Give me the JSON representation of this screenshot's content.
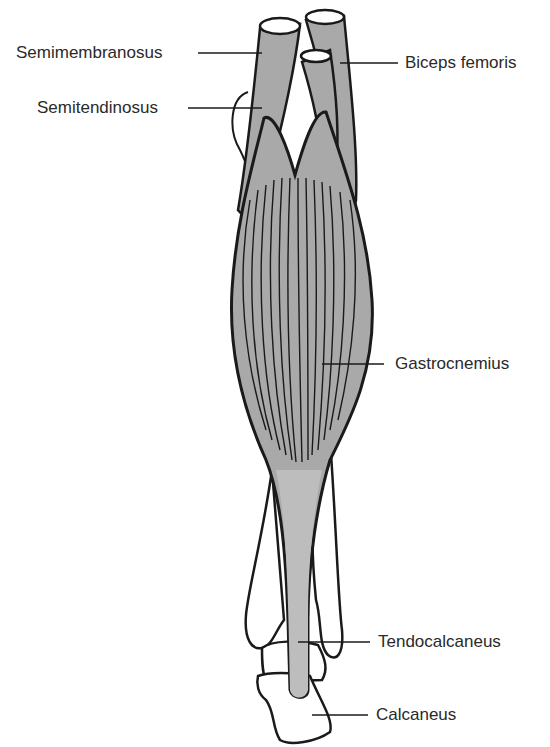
{
  "diagram": {
    "colors": {
      "muscle_fill": "#a9a9a9",
      "tendon_fill": "#b8b8b8",
      "bone_fill": "#ffffff",
      "outline": "#1a1a1a",
      "label_text": "#2a2a2a",
      "background": "#ffffff"
    },
    "labels": [
      {
        "id": "semimembranosus",
        "text": "Semimembranosus",
        "side": "left"
      },
      {
        "id": "semitendinosus",
        "text": "Semitendinosus",
        "side": "left"
      },
      {
        "id": "biceps-femoris",
        "text": "Biceps femoris",
        "side": "right"
      },
      {
        "id": "gastrocnemius",
        "text": "Gastrocnemius",
        "side": "right"
      },
      {
        "id": "tendocalcaneus",
        "text": "Tendocalcaneus",
        "side": "right"
      },
      {
        "id": "calcaneus",
        "text": "Calcaneus",
        "side": "right"
      }
    ]
  }
}
